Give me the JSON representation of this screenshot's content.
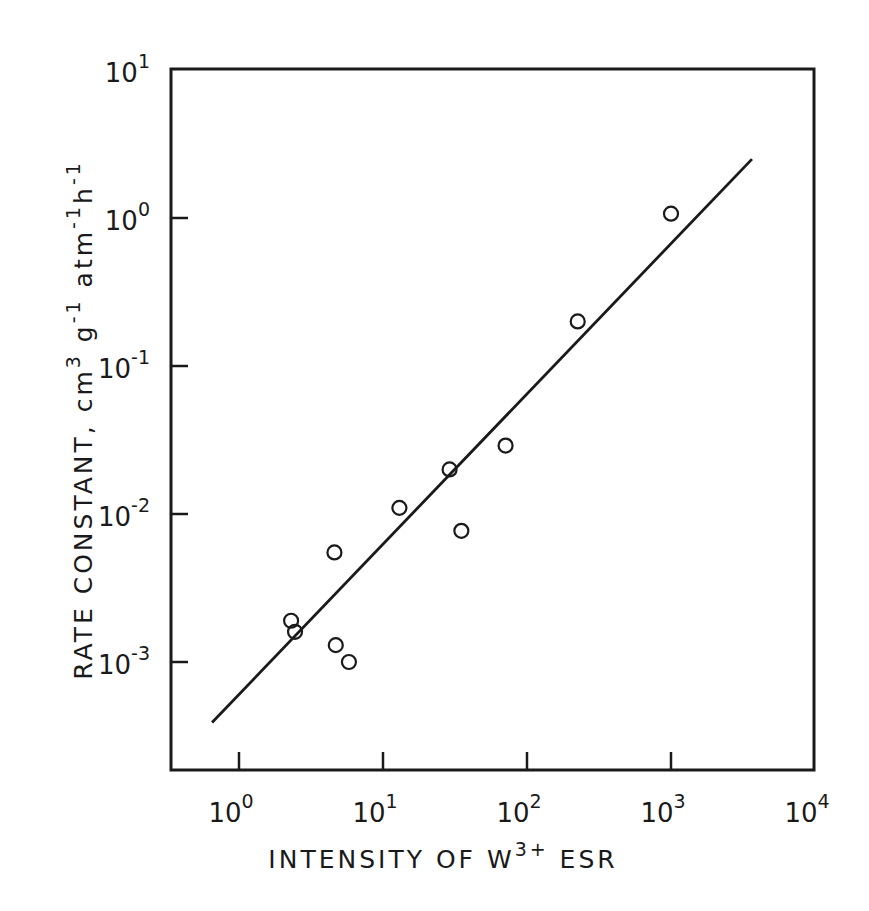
{
  "chart_data": {
    "type": "scatter",
    "title": "",
    "xlabel": "INTENSITY OF W3+ ESR",
    "xlabel_parts": {
      "main": "INTENSITY OF W",
      "sup": "3+",
      "tail": " ESR"
    },
    "ylabel": "RATE CONSTANT, cm3 g-1 atm-1 h-1",
    "ylabel_parts": {
      "a": "RATE CONSTANT, cm",
      "a_sup": "3",
      "b": " g",
      "b_sup": "-1",
      "c": " atm",
      "c_sup": "-1",
      "d": "h",
      "d_sup": "-1"
    },
    "xscale": "log",
    "yscale": "log",
    "xlim": [
      0.23,
      10000
    ],
    "ylim": [
      0.00019,
      10
    ],
    "grid": false,
    "legend": null,
    "xticks": [
      {
        "base": "10",
        "exp": "0",
        "value": 1
      },
      {
        "base": "10",
        "exp": "1",
        "value": 10
      },
      {
        "base": "10",
        "exp": "2",
        "value": 100
      },
      {
        "base": "10",
        "exp": "3",
        "value": 1000
      },
      {
        "base": "10",
        "exp": "4",
        "value": 10000
      }
    ],
    "yticks": [
      {
        "base": "10",
        "exp": "1",
        "value": 10
      },
      {
        "base": "10",
        "exp": "0",
        "value": 1
      },
      {
        "base": "10",
        "exp": "-1",
        "value": 0.1
      },
      {
        "base": "10",
        "exp": "-2",
        "value": 0.01
      },
      {
        "base": "10",
        "exp": "-3",
        "value": 0.001
      }
    ],
    "series": [
      {
        "name": "data",
        "marker": "open-circle",
        "points": [
          {
            "x": 2.3,
            "y": 0.0019
          },
          {
            "x": 2.45,
            "y": 0.0016
          },
          {
            "x": 4.7,
            "y": 0.0013
          },
          {
            "x": 5.8,
            "y": 0.001
          },
          {
            "x": 4.6,
            "y": 0.0055
          },
          {
            "x": 13,
            "y": 0.011
          },
          {
            "x": 29,
            "y": 0.02
          },
          {
            "x": 35,
            "y": 0.0077
          },
          {
            "x": 71,
            "y": 0.029
          },
          {
            "x": 225,
            "y": 0.2
          },
          {
            "x": 1000,
            "y": 1.07
          }
        ]
      },
      {
        "name": "fit line",
        "type": "line",
        "points": [
          {
            "x": 0.65,
            "y": 0.00039
          },
          {
            "x": 3650,
            "y": 2.5
          }
        ]
      }
    ]
  }
}
